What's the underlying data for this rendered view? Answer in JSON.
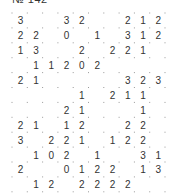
{
  "puzzle": {
    "title": "№ 142",
    "cols": 10,
    "rows": 12,
    "grid": [
      [
        "3",
        "",
        "",
        "3",
        "2",
        "",
        "",
        "2",
        "1",
        "2"
      ],
      [
        "2",
        "2",
        "",
        "0",
        "",
        "1",
        "",
        "3",
        "1",
        "2"
      ],
      [
        "1",
        "3",
        "",
        "",
        "2",
        "",
        "2",
        "2",
        "1",
        ""
      ],
      [
        "",
        "1",
        "1",
        "2",
        "0",
        "2",
        "",
        "",
        "",
        ""
      ],
      [
        "2",
        "1",
        "",
        "",
        "",
        "",
        "",
        "3",
        "2",
        "3"
      ],
      [
        "",
        "",
        "",
        "",
        "1",
        "",
        "2",
        "1",
        "1",
        ""
      ],
      [
        "",
        "",
        "",
        "2",
        "1",
        "",
        "",
        "",
        "1",
        ""
      ],
      [
        "2",
        "1",
        "",
        "1",
        "2",
        "",
        "",
        "2",
        "2",
        ""
      ],
      [
        "3",
        "",
        "2",
        "2",
        "1",
        "",
        "1",
        "2",
        "2",
        ""
      ],
      [
        "",
        "1",
        "0",
        "2",
        "",
        "1",
        "",
        "",
        "3",
        "1"
      ],
      [
        "2",
        "",
        "",
        "0",
        "1",
        "2",
        "2",
        "",
        "1",
        "3"
      ],
      [
        "",
        "1",
        "2",
        "",
        "2",
        "2",
        "2",
        "2",
        "",
        ""
      ]
    ]
  },
  "colors": {
    "line": "#555555",
    "text": "#333333",
    "dot": "#999999",
    "background": "#ffffff"
  }
}
